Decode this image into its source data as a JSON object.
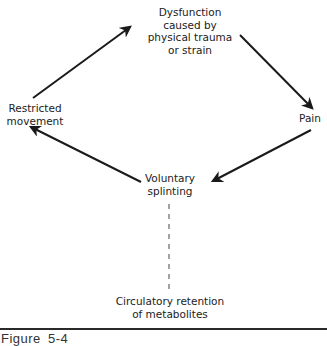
{
  "diagram": {
    "type": "cycle-flow",
    "nodes": {
      "dysfunction": {
        "lines": [
          "Dysfunction",
          "caused by",
          "physical trauma",
          "or strain"
        ]
      },
      "pain": {
        "lines": [
          "Pain"
        ]
      },
      "splinting": {
        "lines": [
          "Voluntary",
          "splinting"
        ]
      },
      "restricted": {
        "lines": [
          "Restricted",
          "movement"
        ]
      },
      "circulatory": {
        "lines": [
          "Circulatory retention",
          "of metabolites"
        ]
      }
    },
    "edges": [
      {
        "from": "dysfunction",
        "to": "pain",
        "style": "solid-arrow"
      },
      {
        "from": "pain",
        "to": "splinting",
        "style": "solid-arrow"
      },
      {
        "from": "splinting",
        "to": "restricted",
        "style": "solid-arrow"
      },
      {
        "from": "restricted",
        "to": "dysfunction",
        "style": "solid-arrow"
      },
      {
        "from": "splinting",
        "to": "circulatory",
        "style": "dashed-line"
      }
    ],
    "colors": {
      "stroke": "#1a1a1a",
      "text": "#222222",
      "background": "#ffffff"
    }
  },
  "caption": {
    "label": "Figure 5-4"
  }
}
